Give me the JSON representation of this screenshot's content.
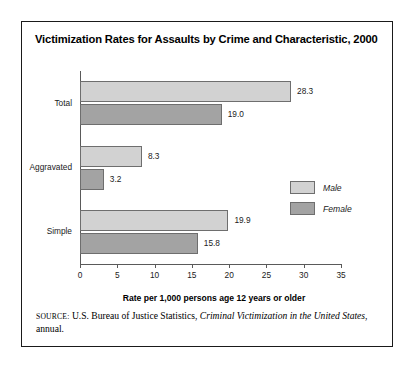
{
  "chart_data": {
    "type": "bar",
    "orientation": "horizontal",
    "title": "Victimization Rates for Assaults by Crime and Characteristic, 2000",
    "categories": [
      "Total",
      "Aggravated",
      "Simple"
    ],
    "series": [
      {
        "name": "Male",
        "color": "#d2d2d2",
        "values": [
          28.3,
          8.3,
          19.9
        ]
      },
      {
        "name": "Female",
        "color": "#a3a3a3",
        "values": [
          19.0,
          3.2,
          15.8
        ]
      }
    ],
    "value_labels": {
      "Total": {
        "Male": "28.3",
        "Female": "19.0"
      },
      "Aggravated": {
        "Male": "8.3",
        "Female": "3.2"
      },
      "Simple": {
        "Male": "19.9",
        "Female": "15.8"
      }
    },
    "xlabel": "Rate per 1,000 persons age 12 years or older",
    "ylabel": "",
    "xlim": [
      0,
      35
    ],
    "xticks": [
      0,
      5,
      10,
      15,
      20,
      25,
      30,
      35
    ],
    "xtick_labels": [
      "0",
      "5",
      "10",
      "15",
      "20",
      "25",
      "30",
      "35"
    ],
    "grid": false,
    "legend_position": "center-right"
  },
  "legend": {
    "items": [
      {
        "label": "Male",
        "color": "#d2d2d2"
      },
      {
        "label": "Female",
        "color": "#a3a3a3"
      }
    ]
  },
  "source": {
    "label": "SOURCE:",
    "text_before": " U.S. Bureau of Justice Statistics, ",
    "publication": "Criminal Victimization in the United States",
    "text_after": ", annual."
  }
}
